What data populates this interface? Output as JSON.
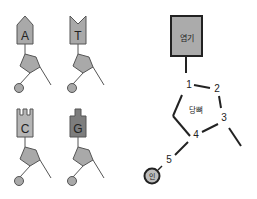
{
  "nucleotides": [
    {
      "base": "A",
      "shape": "arrow-point",
      "fill": "#a9a9a9"
    },
    {
      "base": "T",
      "shape": "notch",
      "fill": "#a9a9a9"
    },
    {
      "base": "C",
      "shape": "double-notch",
      "fill": "#b5b5b5"
    },
    {
      "base": "G",
      "shape": "tab",
      "fill": "#7d7d7d"
    }
  ],
  "structure": {
    "base_label": "염기",
    "sugar_label": "당뼈",
    "phosphate_label": "인",
    "carbons": [
      "1",
      "2",
      "3",
      "4",
      "5"
    ]
  },
  "colors": {
    "gray_fill": "#a9a9a9",
    "dark_fill": "#7d7d7d",
    "stroke": "#555555",
    "line": "#222222"
  }
}
